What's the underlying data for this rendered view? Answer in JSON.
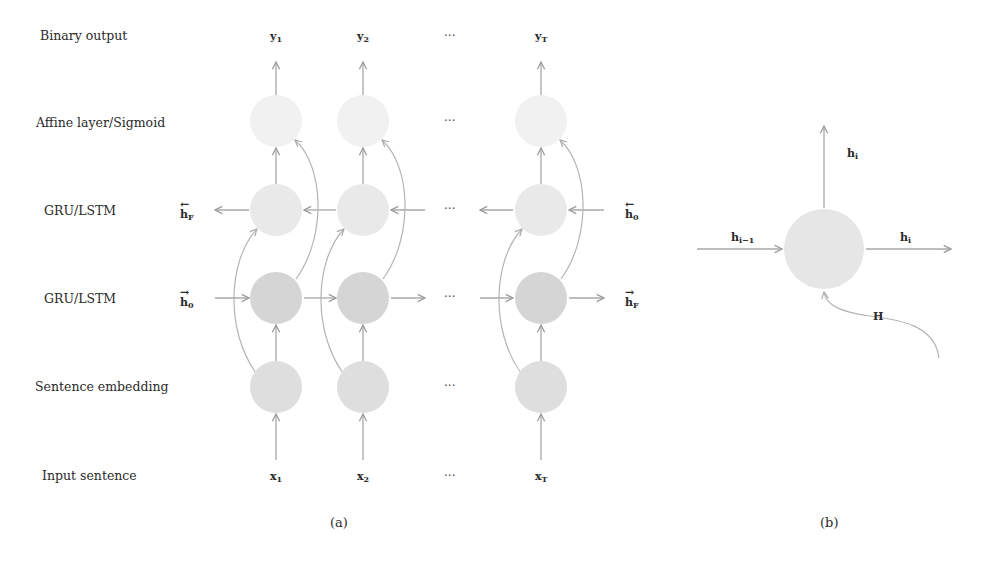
{
  "panel_a": {
    "caption": "(a)",
    "row_labels": {
      "output": "Binary output",
      "affine": "Affine layer/Sigmoid",
      "backward": "GRU/LSTM",
      "forward": "GRU/LSTM",
      "embedding": "Sentence embedding",
      "input": "Input sentence"
    },
    "outputs": [
      {
        "base": "y",
        "sub": "1"
      },
      {
        "base": "y",
        "sub": "2"
      },
      {
        "base": "y",
        "sub": "T"
      }
    ],
    "inputs": [
      {
        "base": "x",
        "sub": "1"
      },
      {
        "base": "x",
        "sub": "2"
      },
      {
        "base": "x",
        "sub": "T"
      }
    ],
    "ellipsis": "···",
    "backward_state_left": {
      "base": "h",
      "sub": "F",
      "arrow": "←"
    },
    "backward_state_right": {
      "base": "h",
      "sub": "0",
      "arrow": "←"
    },
    "forward_state_left": {
      "base": "h",
      "sub": "0",
      "arrow": "→"
    },
    "forward_state_right": {
      "base": "h",
      "sub": "F",
      "arrow": "→"
    },
    "colors": {
      "affine_node": "#f0f0f0",
      "backward_node": "#e8e8e8",
      "forward_node": "#d4d4d4",
      "embedding_node": "#dcdcdc",
      "edge": "#a8a8a8"
    }
  },
  "panel_b": {
    "caption": "(b)",
    "labels": {
      "up": {
        "base": "h",
        "sub": "i"
      },
      "left": {
        "base": "h",
        "sub": "i−1"
      },
      "right": {
        "base": "h",
        "sub": "i"
      },
      "bottom": "H"
    },
    "colors": {
      "node": "#e6e6e6"
    }
  }
}
